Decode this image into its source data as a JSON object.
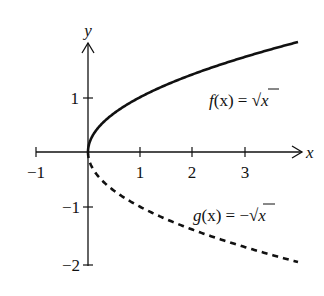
{
  "chart_data": {
    "type": "line",
    "title": "",
    "xlabel": "x",
    "ylabel": "y",
    "xlim": [
      -1,
      4
    ],
    "ylim": [
      -2,
      2
    ],
    "x_ticks": [
      "-1",
      "1",
      "2",
      "3"
    ],
    "y_ticks": [
      "1",
      "-1",
      "-2"
    ],
    "grid": false,
    "series": [
      {
        "name": "f(x) = √x",
        "style": "solid",
        "x": [
          0,
          0.25,
          0.5,
          1,
          2,
          3,
          4
        ],
        "values": [
          0,
          0.5,
          0.707,
          1,
          1.414,
          1.732,
          2
        ]
      },
      {
        "name": "g(x) = −√x",
        "style": "dashed",
        "x": [
          0,
          0.25,
          0.5,
          1,
          2,
          3,
          4
        ],
        "values": [
          0,
          -0.5,
          -0.707,
          -1,
          -1.414,
          -1.732,
          -2
        ]
      }
    ],
    "annotations": [
      "f(x) = √x",
      "g(x) = −√x"
    ]
  },
  "labels": {
    "x_axis": "x",
    "y_axis": "y",
    "xt_m1": "−1",
    "xt_1": "1",
    "xt_2": "2",
    "xt_3": "3",
    "yt_1": "1",
    "yt_m1": "−1",
    "yt_m2": "−2",
    "f_name": "f",
    "f_rest": "(x) = ",
    "f_rad": "x",
    "g_name": "g",
    "g_rest": "(x) = −",
    "g_rad": "x"
  }
}
